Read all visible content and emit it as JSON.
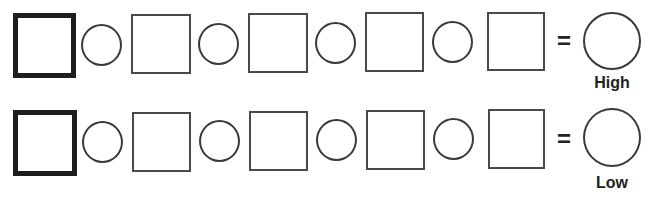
{
  "rows": [
    {
      "result_label": "High",
      "equals": "="
    },
    {
      "result_label": "Low",
      "equals": "="
    }
  ],
  "structure": {
    "sequence": [
      "thick-square",
      "circle",
      "square",
      "circle",
      "square",
      "circle",
      "square",
      "circle",
      "square",
      "equals",
      "result-circle"
    ]
  },
  "colors": {
    "stroke": "#3a3a3a",
    "thick_stroke": "#1e1e1e",
    "background": "#ffffff"
  }
}
